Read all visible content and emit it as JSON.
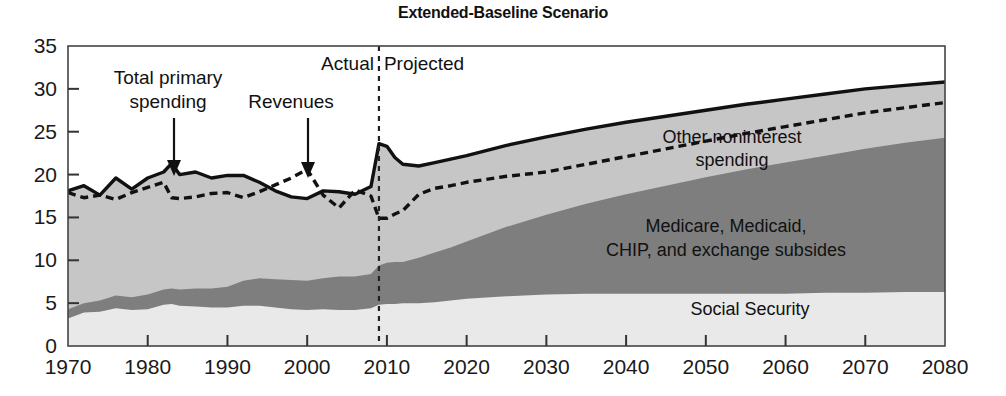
{
  "chart_data": {
    "type": "area",
    "title": "Extended-Baseline Scenario",
    "subtitle": "",
    "xlabel": "",
    "ylabel": "",
    "xlim": [
      1970,
      2080
    ],
    "ylim": [
      0,
      35
    ],
    "grid": false,
    "legend_position": "inline-labels",
    "x_ticks": [
      "1970",
      "1980",
      "1990",
      "2000",
      "2010",
      "2020",
      "2030",
      "2040",
      "2050",
      "2060",
      "2070",
      "2080"
    ],
    "y_ticks": [
      "0",
      "5",
      "10",
      "15",
      "20",
      "25",
      "30",
      "35"
    ],
    "divider_year": 2009,
    "divider_labels": {
      "left": "Actual",
      "right": "Projected"
    },
    "annotations": [
      {
        "text": "Total primary spending",
        "target_year": 1983,
        "target_value": 21.3
      },
      {
        "text": "Revenues",
        "target_year": 2000,
        "target_value": 20.6
      }
    ],
    "band_labels": [
      {
        "text": "Other noninterest spending",
        "id": "other-noninterest"
      },
      {
        "text": "Medicare, Medicaid, CHIP, and exchange subsides",
        "id": "health-programs"
      },
      {
        "text": "Social Security",
        "id": "social-security"
      }
    ],
    "colors": {
      "social_security": "#e9e9e9",
      "health_programs": "#7e7e7e",
      "other_noninterest": "#c6c6c6",
      "spending_line": "#111111",
      "revenues_line": "#111111",
      "axis": "#333333",
      "background": "#ffffff"
    },
    "x": [
      1970,
      1972,
      1974,
      1976,
      1978,
      1980,
      1982,
      1983,
      1984,
      1986,
      1988,
      1990,
      1992,
      1994,
      1996,
      1998,
      2000,
      2002,
      2004,
      2006,
      2008,
      2009,
      2010,
      2011,
      2012,
      2014,
      2016,
      2018,
      2020,
      2025,
      2030,
      2035,
      2040,
      2045,
      2050,
      2055,
      2060,
      2065,
      2070,
      2075,
      2080
    ],
    "series": [
      {
        "name": "Social Security",
        "stack": 1,
        "values": [
          3.2,
          3.9,
          4.0,
          4.4,
          4.2,
          4.3,
          4.8,
          4.9,
          4.7,
          4.6,
          4.5,
          4.5,
          4.7,
          4.7,
          4.5,
          4.3,
          4.2,
          4.3,
          4.2,
          4.2,
          4.4,
          4.8,
          4.9,
          4.9,
          5.0,
          5.0,
          5.1,
          5.3,
          5.5,
          5.8,
          6.0,
          6.1,
          6.1,
          6.1,
          6.1,
          6.1,
          6.1,
          6.2,
          6.2,
          6.3,
          6.3
        ]
      },
      {
        "name": "Medicare, Medicaid, CHIP, and exchange subsides",
        "stack": 2,
        "values": [
          4.3,
          5.0,
          5.3,
          5.9,
          5.7,
          6.0,
          6.6,
          6.7,
          6.6,
          6.7,
          6.7,
          6.9,
          7.6,
          7.9,
          7.8,
          7.7,
          7.6,
          7.9,
          8.1,
          8.1,
          8.4,
          9.4,
          9.7,
          9.8,
          9.8,
          10.3,
          10.9,
          11.5,
          12.2,
          13.9,
          15.3,
          16.6,
          17.7,
          18.7,
          19.7,
          20.6,
          21.4,
          22.2,
          23.0,
          23.7,
          24.3
        ]
      },
      {
        "name": "Other noninterest spending",
        "stack": 3,
        "values": [
          18.1,
          18.7,
          17.6,
          19.6,
          18.3,
          19.6,
          20.3,
          21.3,
          20.0,
          20.3,
          19.6,
          19.9,
          19.9,
          19.1,
          18.1,
          17.4,
          17.2,
          18.1,
          18.0,
          17.7,
          18.6,
          23.6,
          23.3,
          22.0,
          21.2,
          21.0,
          21.4,
          21.8,
          22.2,
          23.4,
          24.4,
          25.3,
          26.1,
          26.8,
          27.5,
          28.2,
          28.8,
          29.4,
          30.0,
          30.4,
          30.8
        ]
      },
      {
        "name": "Revenues",
        "stack": 0,
        "style": "dashed",
        "values": [
          17.9,
          17.3,
          17.6,
          17.1,
          17.9,
          18.5,
          19.1,
          17.3,
          17.2,
          17.4,
          17.8,
          17.9,
          17.3,
          18.0,
          18.8,
          19.6,
          20.6,
          17.6,
          16.1,
          18.2,
          17.5,
          14.9,
          14.9,
          15.4,
          15.8,
          17.7,
          18.4,
          18.7,
          19.1,
          19.8,
          20.3,
          21.2,
          22.1,
          23.0,
          23.9,
          24.8,
          25.6,
          26.4,
          27.2,
          27.8,
          28.4
        ]
      }
    ]
  }
}
